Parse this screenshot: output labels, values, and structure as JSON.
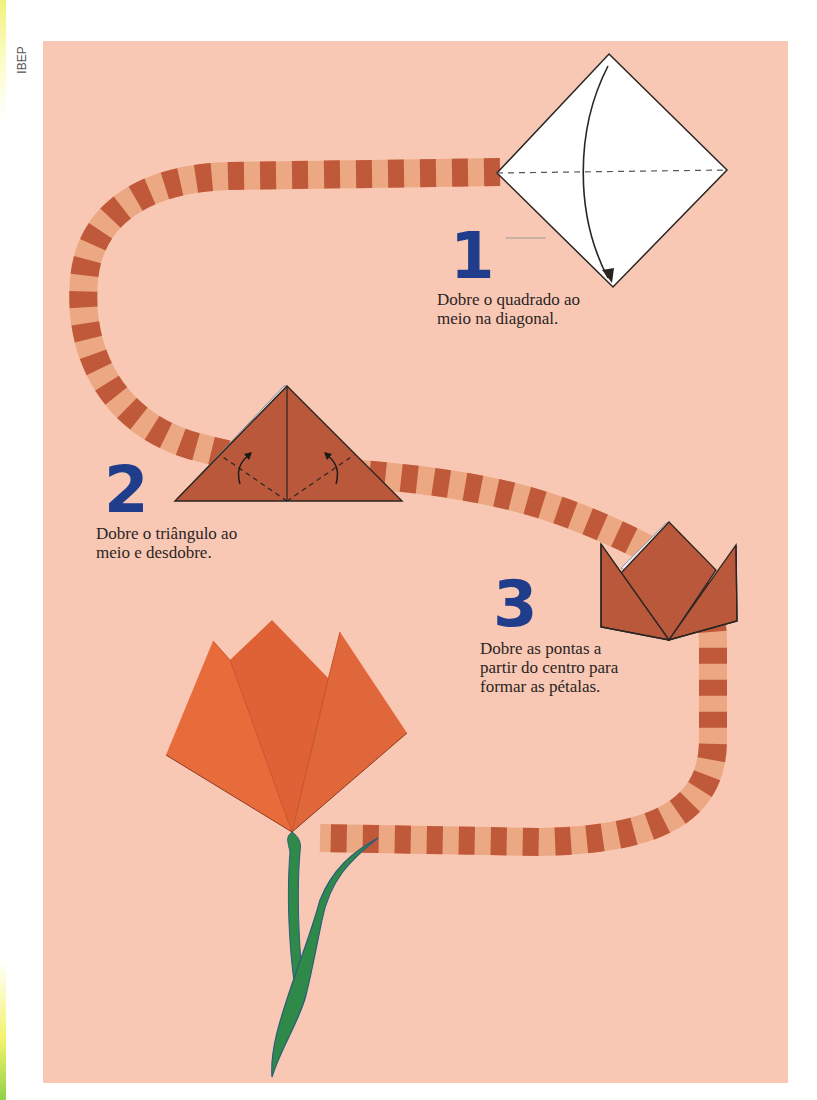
{
  "publisher": "IBEP",
  "colors": {
    "background": "#f8c8b5",
    "band_dark": "#c0593a",
    "band_light": "#eba882",
    "paper_brown": "#b9583a",
    "tulip_orange": "#e5663a",
    "stem_green": "#2f8a4a",
    "number_blue": "#1f3d8a"
  },
  "steps": [
    {
      "number": "1",
      "text": "Dobre o quadrado ao\nmeio na diagonal.",
      "figure": "white-square-diamond-with-fold-arrow"
    },
    {
      "number": "2",
      "text": "Dobre o triângulo ao\nmeio e desdobre.",
      "figure": "brown-triangle-with-fold-lines"
    },
    {
      "number": "3",
      "text": "Dobre as pontas a\npartir do centro para\nformar as pétalas.",
      "figure": "brown-tulip-head-folded"
    }
  ],
  "final": {
    "figure": "orange-origami-tulip-with-stem"
  }
}
